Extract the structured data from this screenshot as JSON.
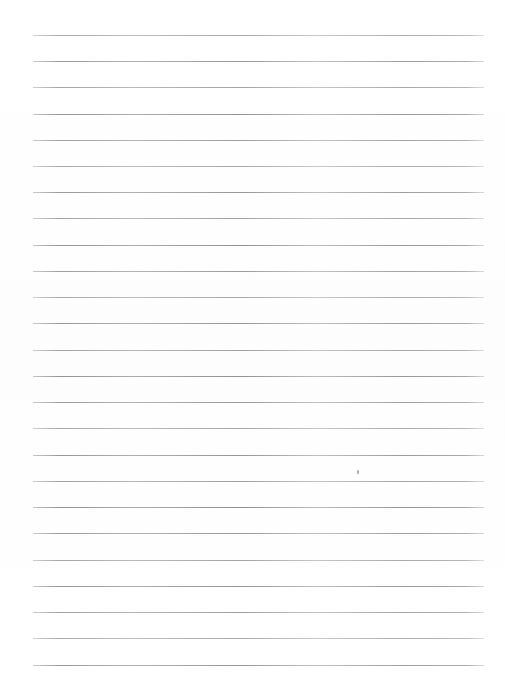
{
  "document": {
    "kind": "scanned-ruled-paper",
    "title": "Blank Ruled Paper",
    "width": 505,
    "height": 676,
    "background_color": "#ffffff",
    "text_content": "",
    "notes": "Blank lined notebook page scan; no handwriting or printed text present."
  },
  "ruling": {
    "line_color": "#bcbcbc",
    "line_thickness_px": 1,
    "line_count": 25,
    "line_left_px": 33,
    "line_right_px": 484,
    "line_width_px": 451,
    "first_line_y_px": 35,
    "last_line_y_px": 665,
    "line_spacing_px": 26.25,
    "top_margin_px": 35,
    "bottom_margin_px": 11,
    "left_margin_px": 33,
    "right_margin_px": 21,
    "line_y_positions": [
      35,
      61,
      87,
      114,
      140,
      166,
      192,
      218,
      245,
      271,
      297,
      323,
      350,
      376,
      402,
      428,
      455,
      481,
      507,
      533,
      560,
      586,
      612,
      638,
      665
    ]
  },
  "artifacts": {
    "speck": {
      "label": "scan-dust-speck",
      "x_px": 357,
      "y_px": 470,
      "width_px": 2,
      "height_px": 4,
      "color": "#aaaaaf"
    }
  }
}
